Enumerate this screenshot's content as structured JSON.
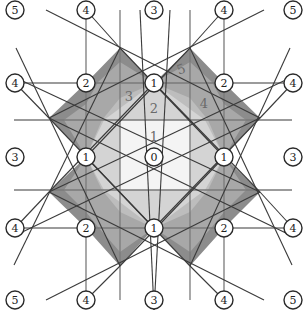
{
  "diagram": {
    "colors": {
      "background": "#ffffff",
      "level1_fill": "#f2f2f2",
      "level2_fill": "#d4d4d4",
      "level3_fill": "#bdbdbd",
      "level4_fill": "#a8a8a8",
      "level5_fill": "#8c8c8c",
      "line": "#3a3a3a"
    },
    "region_labels": [
      {
        "text": "1",
        "x": 154,
        "y": 136
      },
      {
        "text": "2",
        "x": 154,
        "y": 108
      },
      {
        "text": "3",
        "x": 129,
        "y": 96
      },
      {
        "text": "4",
        "x": 204,
        "y": 103
      },
      {
        "text": "5",
        "x": 181,
        "y": 69
      }
    ],
    "nodes": [
      {
        "label": "0",
        "x": 154,
        "y": 157
      },
      {
        "label": "1",
        "x": 154,
        "y": 83
      },
      {
        "label": "1",
        "x": 86,
        "y": 157
      },
      {
        "label": "1",
        "x": 224,
        "y": 157
      },
      {
        "label": "1",
        "x": 154,
        "y": 228
      },
      {
        "label": "2",
        "x": 86,
        "y": 83
      },
      {
        "label": "2",
        "x": 224,
        "y": 83
      },
      {
        "label": "2",
        "x": 86,
        "y": 228
      },
      {
        "label": "2",
        "x": 224,
        "y": 228
      },
      {
        "label": "3",
        "x": 154,
        "y": 10
      },
      {
        "label": "3",
        "x": 15,
        "y": 157
      },
      {
        "label": "3",
        "x": 293,
        "y": 157
      },
      {
        "label": "3",
        "x": 154,
        "y": 300
      },
      {
        "label": "4",
        "x": 86,
        "y": 10
      },
      {
        "label": "4",
        "x": 224,
        "y": 10
      },
      {
        "label": "4",
        "x": 15,
        "y": 83
      },
      {
        "label": "4",
        "x": 293,
        "y": 83
      },
      {
        "label": "4",
        "x": 15,
        "y": 228
      },
      {
        "label": "4",
        "x": 293,
        "y": 228
      },
      {
        "label": "4",
        "x": 86,
        "y": 300
      },
      {
        "label": "4",
        "x": 224,
        "y": 300
      },
      {
        "label": "5",
        "x": 15,
        "y": 10
      },
      {
        "label": "5",
        "x": 293,
        "y": 10
      },
      {
        "label": "5",
        "x": 15,
        "y": 300
      },
      {
        "label": "5",
        "x": 293,
        "y": 300
      }
    ]
  }
}
